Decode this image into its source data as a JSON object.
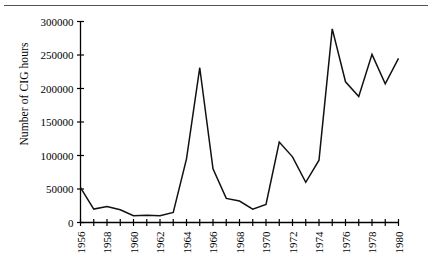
{
  "figure": {
    "ylabel": "Number of CIG hours",
    "y_ticks": [
      "0",
      "50000",
      "100000",
      "150000",
      "200000",
      "250000",
      "300000"
    ],
    "x_ticks": [
      "1956",
      "1958",
      "1960",
      "1962",
      "1964",
      "1966",
      "1968",
      "1970",
      "1972",
      "1974",
      "1976",
      "1978",
      "1980"
    ],
    "line_color": "#111111",
    "axis_color": "#000000",
    "rule_color": "#55524f"
  },
  "chart_data": {
    "type": "line",
    "title": "",
    "xlabel": "",
    "ylabel": "Number of CIG hours",
    "xlim": [
      1956,
      1980
    ],
    "ylim": [
      0,
      300000
    ],
    "ytick_values": [
      0,
      50000,
      100000,
      150000,
      200000,
      250000,
      300000
    ],
    "xtick_values": [
      1956,
      1958,
      1960,
      1962,
      1964,
      1966,
      1968,
      1970,
      1972,
      1974,
      1976,
      1978,
      1980
    ],
    "xtick_minor_step": 1,
    "grid": false,
    "legend": false,
    "x": [
      1956,
      1957,
      1958,
      1959,
      1960,
      1961,
      1962,
      1963,
      1964,
      1965,
      1966,
      1967,
      1968,
      1969,
      1970,
      1971,
      1972,
      1973,
      1974,
      1975,
      1976,
      1977,
      1978,
      1979,
      1980
    ],
    "values": [
      52000,
      20000,
      24000,
      19000,
      10000,
      11000,
      10000,
      15000,
      95000,
      231000,
      80000,
      36000,
      32000,
      20000,
      27000,
      120000,
      98000,
      60000,
      93000,
      289000,
      210000,
      188000,
      251000,
      207000,
      245000
    ]
  }
}
